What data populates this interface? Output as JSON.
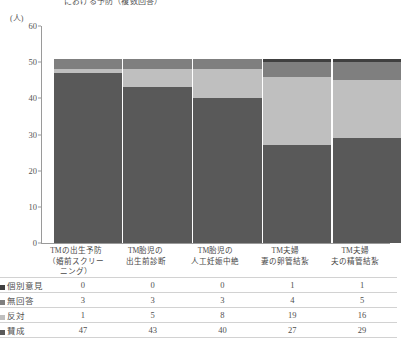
{
  "chart_data": {
    "type": "bar",
    "stacked": true,
    "title": "における予防（複数回答）",
    "unit_label": "(人)",
    "xlabel": "",
    "ylabel": "",
    "ylim": [
      0,
      60
    ],
    "yticks": [
      0,
      10,
      20,
      30,
      40,
      50,
      60
    ],
    "grid": false,
    "legend_position": "table-left",
    "categories": [
      "TMの出生予防\n（婚前スクリーニング）",
      "TM胎児の\n出生前診断",
      "TM胎児の\n人工妊娠中絶",
      "TM夫婦\n妻の卵管結紮",
      "TM夫婦\n夫の精管結紮"
    ],
    "category_lines": [
      [
        "TMの出生予防",
        "（婚前スクリー",
        "ニング）"
      ],
      [
        "TM胎児の",
        "出生前診断"
      ],
      [
        "TM胎児の",
        "人工妊娠中絶"
      ],
      [
        "TM夫婦",
        "妻の卵管結紮"
      ],
      [
        "TM夫婦",
        "夫の精管結紮"
      ]
    ],
    "series": [
      {
        "name": "賛成",
        "values": [
          47,
          43,
          40,
          27,
          29
        ],
        "color": "#595959"
      },
      {
        "name": "反対",
        "values": [
          1,
          5,
          8,
          19,
          16
        ],
        "color": "#bfbfbf"
      },
      {
        "name": "無回答",
        "values": [
          3,
          3,
          3,
          4,
          5
        ],
        "color": "#7f7f7f"
      },
      {
        "name": "個別意見",
        "values": [
          0,
          0,
          0,
          1,
          1
        ],
        "color": "#404040"
      }
    ],
    "stack_order_bottom_to_top": [
      "賛成",
      "反対",
      "無回答",
      "個別意見"
    ]
  },
  "table": {
    "rows": [
      {
        "label": "個別意見",
        "color": "#404040",
        "values": [
          "0",
          "0",
          "0",
          "1",
          "1"
        ]
      },
      {
        "label": "無回答",
        "color": "#7f7f7f",
        "values": [
          "3",
          "3",
          "3",
          "4",
          "5"
        ]
      },
      {
        "label": "反対",
        "color": "#bfbfbf",
        "values": [
          "1",
          "5",
          "8",
          "19",
          "16"
        ]
      },
      {
        "label": "賛成",
        "color": "#595959",
        "values": [
          "47",
          "43",
          "40",
          "27",
          "29"
        ]
      }
    ]
  }
}
